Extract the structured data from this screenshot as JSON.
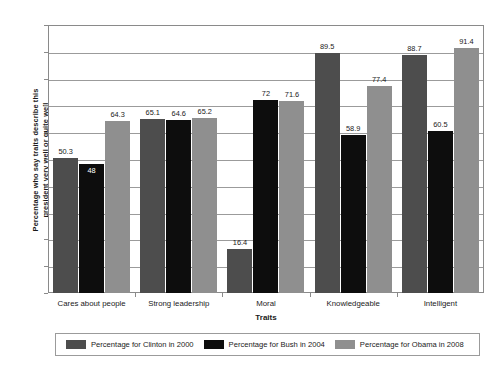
{
  "chart_data": {
    "type": "bar",
    "title": "",
    "xlabel": "Traits",
    "ylabel": "Percentage who say traits describe this president very well or quite well",
    "ylabel_lines": [
      "Percentage who say traits describe this",
      "president very well or quite well"
    ],
    "ylim": [
      0,
      100
    ],
    "yticks": [
      0,
      10,
      20,
      30,
      40,
      50,
      60,
      70,
      80,
      90,
      100
    ],
    "ytick_labels": [
      "0",
      "10",
      "20",
      "30",
      "40",
      "50",
      "60",
      "70",
      "80",
      "90",
      "100"
    ],
    "grid": true,
    "legend_position": "bottom",
    "categories": [
      "Cares about people",
      "Strong leadership",
      "Moral",
      "Knowledgeable",
      "Intelligent"
    ],
    "series": [
      {
        "name": "Percentage for Clinton in 2000",
        "color": "#4d4d4d",
        "values": [
          50.3,
          65.1,
          16.4,
          89.5,
          88.7
        ],
        "value_labels": [
          "50.3",
          "65.1",
          "16.4",
          "89.5",
          "88.7"
        ]
      },
      {
        "name": "Percentage for Bush in 2004",
        "color": "#0d0d0d",
        "values": [
          48,
          64.6,
          72,
          58.9,
          60.5
        ],
        "value_labels": [
          "48",
          "64.6",
          "72",
          "58.9",
          "60.5"
        ]
      },
      {
        "name": "Percentage for Obama in 2008",
        "color": "#8f8f8f",
        "values": [
          64.3,
          65.2,
          71.6,
          77.4,
          91.4
        ],
        "value_labels": [
          "64.3",
          "65.2",
          "71.6",
          "77.4",
          "91.4"
        ]
      }
    ]
  }
}
